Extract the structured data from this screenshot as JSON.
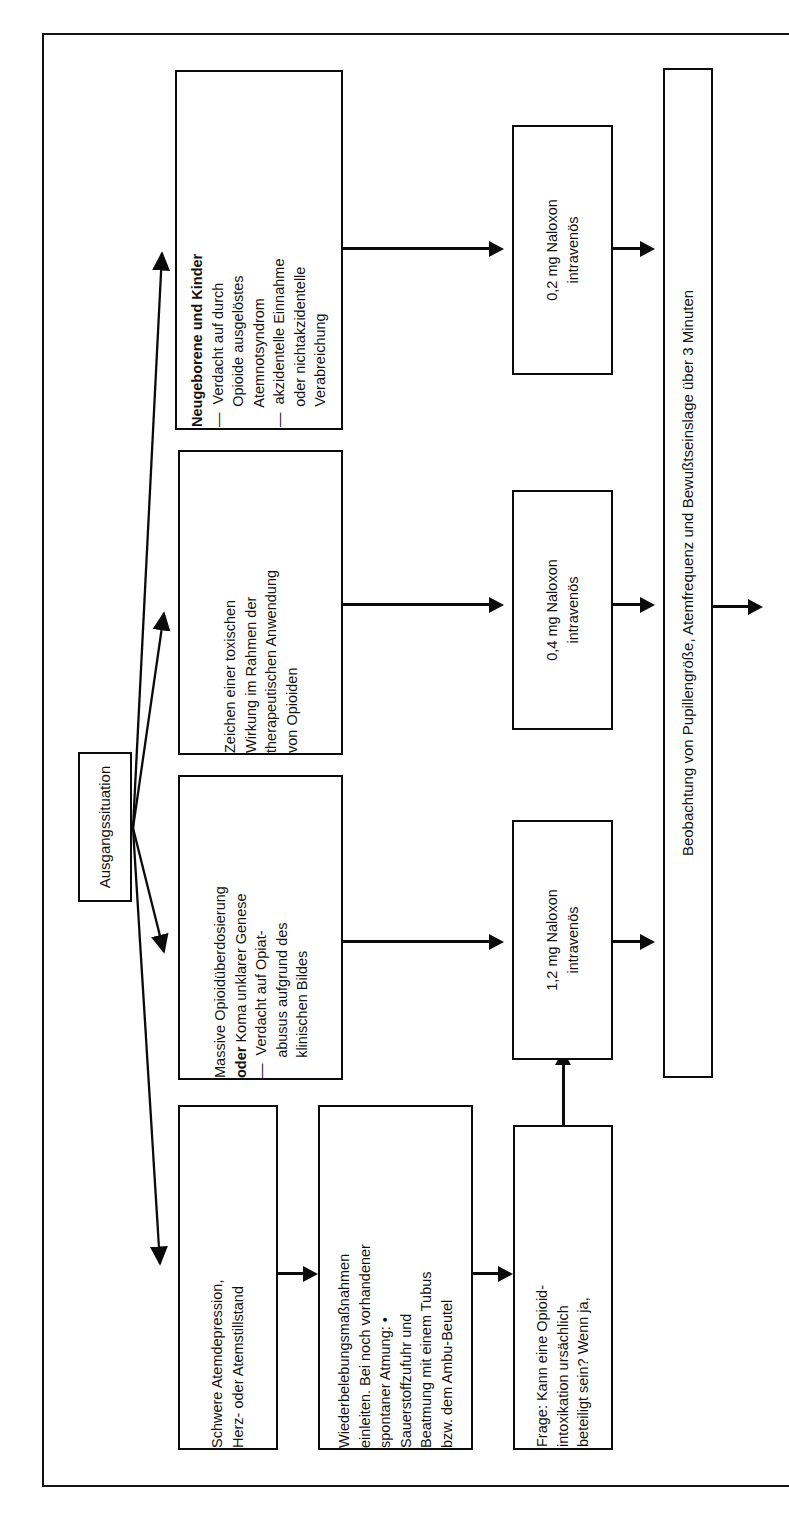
{
  "figure": {
    "orientation": "rotated-90-ccw",
    "language": "de",
    "ink_color": "#0b0b0b",
    "paper_color": "#ffffff"
  },
  "start": {
    "label": "Ausgangssituation"
  },
  "conditions": [
    {
      "id": "neugeborene",
      "title": "Neugeborene und Kinder",
      "line1": "—  Verdacht auf durch",
      "line2": "     Opioide ausgelöstes",
      "line3": "     Atemnotsyndrom",
      "line4": "—  akzidentelle Einnahme",
      "line5": "     oder nichtakzidentelle",
      "line6": "     Verabreichung"
    },
    {
      "id": "toxisch",
      "line1": "Zeichen einer toxischen",
      "line2": "Wirkung im Rahmen der",
      "line3": "therapeutischen Anwendung",
      "line4": "von Opioiden"
    },
    {
      "id": "massive",
      "title": "Massive Opioidüberdosierung",
      "title_bold": "oder",
      "title_rest": " Koma unklarer Genese",
      "line1": "—  Verdacht auf Opiat-",
      "line2": "     abusus aufgrund des",
      "line3": "     klinischen Bildes"
    },
    {
      "id": "atemdepression",
      "line1": "Schwere Atemdepression,",
      "line2": "Herz- oder Atemstillstand"
    }
  ],
  "resuscitation": {
    "line1": "Wiederbelebungsmaßnahmen",
    "line2": "einleiten. Bei noch vorhandener",
    "line3": "spontaner Atmung: •",
    "line4": "Sauerstoffzufuhr und",
    "line5": "Beatmung mit einem Tubus",
    "line6": "bzw. dem Ambu-Beutel"
  },
  "question": {
    "line1": "Frage: Kann eine Opioid-",
    "line2": "intoxikation ursächlich",
    "line3": "beteiligt sein? Wenn ja,"
  },
  "doses": [
    {
      "id": "dose-02",
      "amount": "0,2 mg Naloxon",
      "route": "intravenös"
    },
    {
      "id": "dose-04",
      "amount": "0,4 mg Naloxon",
      "route": "intravenös"
    },
    {
      "id": "dose-12",
      "amount": "1,2 mg Naloxon",
      "route": "intravenös"
    }
  ],
  "observation": {
    "text": "Beobachtung von Pupillengröße, Atemfrequenz und Bewußtseinslage über 3 Minuten"
  }
}
